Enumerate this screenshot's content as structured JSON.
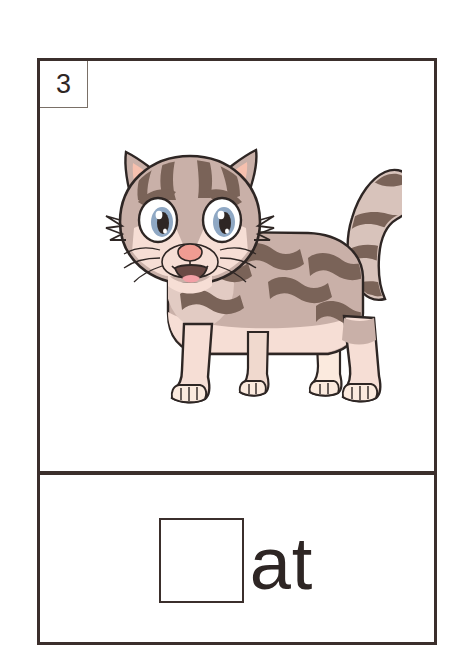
{
  "card": {
    "number_label": "3",
    "border_color": "#3b2f2c",
    "background_color": "#ffffff"
  },
  "picture": {
    "subject": "cat",
    "icon_name": "cartoon-tabby-cat-illustration",
    "alt_text": "cartoon grey tabby cat standing with curled striped tail",
    "colors": {
      "fur_base": "#bda7a1",
      "fur_light": "#f6ded5",
      "fur_shadow": "#c9b0a8",
      "stripe": "#7a6358",
      "outline": "#2e2624",
      "ear_inner": "#f6c0ae",
      "nose": "#f09c92",
      "mouth": "#6b4a45",
      "tongue": "#f3a0a6",
      "eye_iris": "#8fa8c4",
      "eye_pupil": "#2e2624",
      "eye_white": "#ffffff",
      "paw": "#fbeade"
    }
  },
  "word_exercise": {
    "answer_box_name": "blank-letter-box",
    "answer_box_value": "",
    "suffix": "at"
  }
}
